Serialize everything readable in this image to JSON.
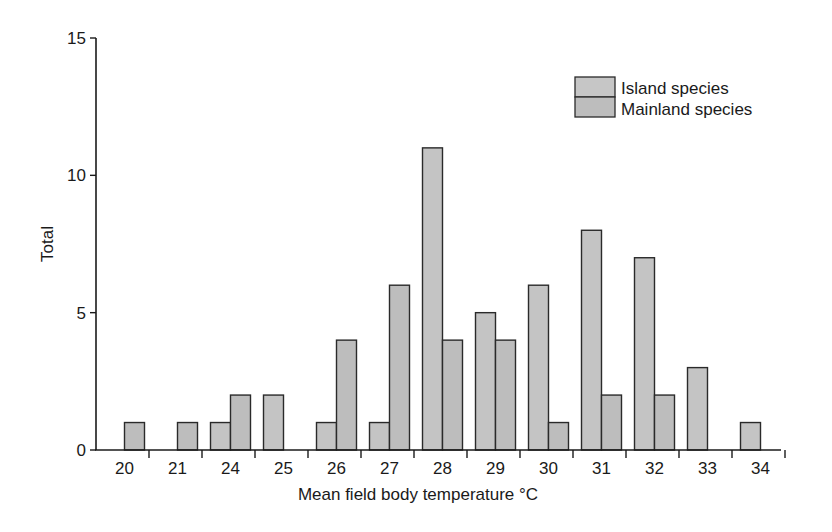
{
  "chart_data": {
    "type": "bar",
    "title": "",
    "xlabel": "Mean field body temperature °C",
    "ylabel": "Total",
    "ylim": [
      0,
      15
    ],
    "yticks": [
      0,
      5,
      10,
      15
    ],
    "grid": false,
    "legend_position": "top-right",
    "categories": [
      "20",
      "21",
      "24",
      "25",
      "26",
      "27",
      "28",
      "29",
      "30",
      "31",
      "32",
      "33",
      "34"
    ],
    "series": [
      {
        "name": "Island species",
        "color": "#c4c4c4",
        "values": [
          0,
          0,
          1,
          2,
          1,
          1,
          11,
          5,
          6,
          8,
          7,
          3,
          1
        ]
      },
      {
        "name": "Mainland species",
        "color": "#bdbdbd",
        "values": [
          1,
          1,
          2,
          0,
          4,
          6,
          4,
          4,
          1,
          2,
          2,
          0,
          0
        ]
      }
    ]
  },
  "legend": {
    "items": [
      {
        "label": "Island species"
      },
      {
        "label": "Mainland species"
      }
    ]
  },
  "axes": {
    "x_title": "Mean field body temperature °C",
    "y_title": "Total",
    "y_tick_labels": [
      "0",
      "5",
      "10",
      "15"
    ]
  }
}
